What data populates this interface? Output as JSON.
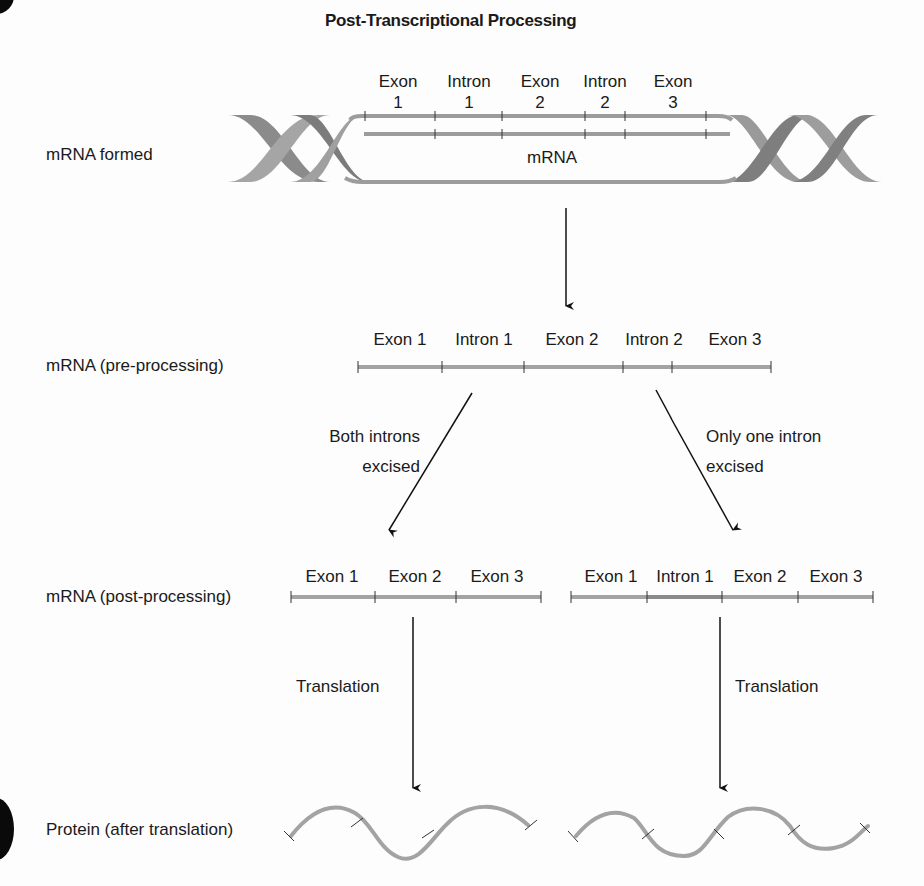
{
  "title": "Post-Transcriptional Processing",
  "colors": {
    "strand": "#a3a3a3",
    "strand_dark": "#8a8a8a",
    "helix_light": "#9a9a9a",
    "helix_dark": "#7a7a7a",
    "arrow": "#111111",
    "text": "#1a1a1a"
  },
  "rows": {
    "formed": {
      "label": "mRNA formed",
      "mrna_label": "mRNA",
      "segments": [
        {
          "top": "Exon",
          "bottom": "1"
        },
        {
          "top": "Intron",
          "bottom": "1"
        },
        {
          "top": "Exon",
          "bottom": "2"
        },
        {
          "top": "Intron",
          "bottom": "2"
        },
        {
          "top": "Exon",
          "bottom": "3"
        }
      ]
    },
    "pre": {
      "label": "mRNA (pre-processing)",
      "segments": [
        "Exon 1",
        "Intron 1",
        "Exon 2",
        "Intron 2",
        "Exon 3"
      ]
    },
    "post": {
      "label": "mRNA (post-processing)",
      "left_segments": [
        "Exon 1",
        "Exon 2",
        "Exon 3"
      ],
      "right_segments": [
        "Exon 1",
        "Intron 1",
        "Exon 2",
        "Exon 3"
      ]
    },
    "protein": {
      "label": "Protein (after translation)"
    }
  },
  "arrows": {
    "left_branch": {
      "line1": "Both introns",
      "line2": "excised"
    },
    "right_branch": {
      "line1": "Only one intron",
      "line2": "excised"
    },
    "translation_left": "Translation",
    "translation_right": "Translation"
  }
}
